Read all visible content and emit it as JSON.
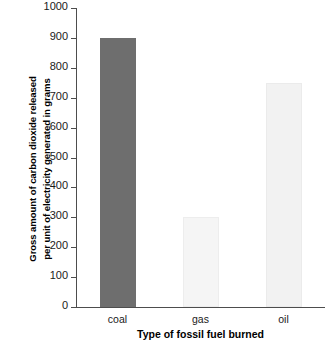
{
  "chart_data": {
    "type": "bar",
    "title": "",
    "subtitle": "",
    "xlabel": "Type of fossil fuel burned",
    "ylabel": "Gross amount of carbon dioxide released per unit of electricity generated in grams",
    "ylabel_line1": "Gross amount of carbon dioxide released",
    "ylabel_line2": "per unit of electricity generated in grams",
    "categories": [
      "coal",
      "gas",
      "oil"
    ],
    "values": [
      900,
      300,
      750
    ],
    "ylim": [
      0,
      1000
    ],
    "ytick_labels": [
      "0",
      "100",
      "200",
      "300",
      "400",
      "500",
      "600",
      "700",
      "800",
      "900",
      "1000"
    ],
    "ytick_values": [
      0,
      100,
      200,
      300,
      400,
      500,
      600,
      700,
      800,
      900,
      1000
    ],
    "grid": false,
    "legend": "none",
    "bar_colors": [
      "#6e6e6e",
      "#f5f5f5",
      "#f2f2f2"
    ],
    "bar_edge_colors": [
      "#6e6e6e",
      "#ededed",
      "#ebebeb"
    ],
    "axis_color": "#4d4d4d",
    "background": "#ffffff"
  }
}
